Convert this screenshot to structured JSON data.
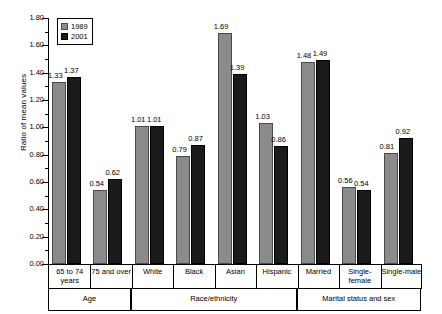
{
  "chart_data": {
    "type": "bar",
    "title": "",
    "xlabel": "",
    "ylabel": "Ratio of mean values",
    "ylim": [
      0.0,
      1.8
    ],
    "ytick_step": 0.2,
    "ytick_labels": [
      "0.00",
      "0.20",
      "0.40",
      "0.60",
      "0.80",
      "1.00",
      "1.20",
      "1.40",
      "1.60",
      "1.80"
    ],
    "grid": false,
    "legend_position": "top-left",
    "categories": [
      "65 to 74 years",
      "75 and over",
      "White",
      "Black",
      "Asian",
      "Hispanic",
      "Married",
      "Single-female",
      "Single-male"
    ],
    "series": [
      {
        "name": "1989",
        "color": "#8b8b8b",
        "values": [
          1.33,
          0.54,
          1.01,
          0.79,
          1.69,
          1.03,
          1.48,
          0.56,
          0.81
        ]
      },
      {
        "name": "2001",
        "color": "#1b1b1b",
        "values": [
          1.37,
          0.62,
          1.01,
          0.87,
          1.39,
          0.86,
          1.49,
          0.54,
          0.92
        ]
      }
    ],
    "groups": [
      {
        "label": "Age",
        "categories": [
          "65 to 74 years",
          "75 and over"
        ]
      },
      {
        "label": "Race/ethnicity",
        "categories": [
          "White",
          "Black",
          "Asian",
          "Hispanic"
        ]
      },
      {
        "label": "Marital status and sex",
        "categories": [
          "Married",
          "Single-female",
          "Single-male"
        ]
      }
    ]
  },
  "axis": {
    "y_label": "Ratio of mean values",
    "y_ticks": [
      "1.80",
      "1.60",
      "1.40",
      "1.20",
      "1.00",
      "0.80",
      "0.60",
      "0.40",
      "0.20",
      "0.00"
    ]
  },
  "legend": {
    "items": [
      {
        "label": "1989"
      },
      {
        "label": "2001"
      }
    ]
  },
  "categories": [
    {
      "line1": "65 to 74",
      "line2": "years"
    },
    {
      "line1": "75 and over",
      "line2": ""
    },
    {
      "line1": "White",
      "line2": ""
    },
    {
      "line1": "Black",
      "line2": ""
    },
    {
      "line1": "Asian",
      "line2": ""
    },
    {
      "line1": "Hispanic",
      "line2": ""
    },
    {
      "line1": "Married",
      "line2": ""
    },
    {
      "line1": "Single-",
      "line2": "female"
    },
    {
      "line1": "Single-male",
      "line2": ""
    }
  ],
  "groups": [
    {
      "label": "Age"
    },
    {
      "label": "Race/ethnicity"
    },
    {
      "label": "Marital status and sex"
    }
  ],
  "values": {
    "g0": {
      "a": "1.33",
      "b": "1.37"
    },
    "g1": {
      "a": "0.54",
      "b": "0.62"
    },
    "g2": {
      "a": "1.01",
      "b": "1.01"
    },
    "g3": {
      "a": "0.79",
      "b": "0.87"
    },
    "g4": {
      "a": "1.69",
      "b": "1.39"
    },
    "g5": {
      "a": "1.03",
      "b": "0.86"
    },
    "g6": {
      "a": "1.48",
      "b": "1.49"
    },
    "g7": {
      "a": "0.56",
      "b": "0.54"
    },
    "g8": {
      "a": "0.81",
      "b": "0.92"
    }
  }
}
